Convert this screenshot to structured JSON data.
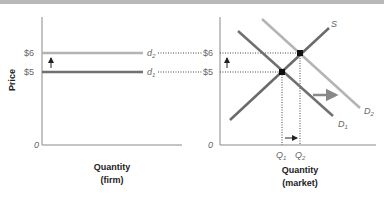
{
  "left_panel": {
    "y_axis_label": "Price",
    "x_axis_label_line1": "Quantity",
    "x_axis_label_line2": "(firm)",
    "origin": "0",
    "price_high": "$6",
    "price_low": "$5",
    "demand_high_label": "d",
    "demand_high_sub": "2",
    "demand_low_label": "d",
    "demand_low_sub": "1"
  },
  "right_panel": {
    "x_axis_label_line1": "Quantity",
    "x_axis_label_line2": "(market)",
    "origin": "0",
    "price_high": "$6",
    "price_low": "$5",
    "supply_label": "S",
    "d1_label": "D",
    "d1_sub": "1",
    "d2_label": "D",
    "d2_sub": "2",
    "q1_label": "Q",
    "q1_sub": "1",
    "q2_label": "Q",
    "q2_sub": "2"
  },
  "colors": {
    "d1_line": "#707070",
    "d2_line": "#b4b4b4",
    "supply_line": "#6a6a6a",
    "axis": "#888888",
    "arrow": "#888888"
  }
}
